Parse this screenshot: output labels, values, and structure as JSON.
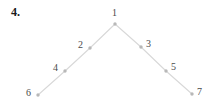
{
  "figure": {
    "problem_number": "4.",
    "caption": "",
    "background_color": "#ffffff",
    "edge_color": "#d8d8d8",
    "node_color": "#b8b8b8",
    "label_color": "#4a4a4a"
  },
  "chart_data": {
    "type": "diagram",
    "diagram_kind": "graph-path",
    "title": "4.",
    "xlabel": "",
    "ylabel": "",
    "nodes": [
      {
        "id": "1",
        "label": "1",
        "x": 115,
        "y": 24,
        "label_x": 112,
        "label_y": 8,
        "label_anchor": "above"
      },
      {
        "id": "2",
        "label": "2",
        "x": 90,
        "y": 48,
        "label_x": 78,
        "label_y": 40,
        "label_anchor": "left"
      },
      {
        "id": "3",
        "label": "3",
        "x": 141,
        "y": 47,
        "label_x": 146,
        "label_y": 39,
        "label_anchor": "right"
      },
      {
        "id": "4",
        "label": "4",
        "x": 65,
        "y": 71,
        "label_x": 53,
        "label_y": 63,
        "label_anchor": "left"
      },
      {
        "id": "5",
        "label": "5",
        "x": 166,
        "y": 71,
        "label_x": 171,
        "label_y": 62,
        "label_anchor": "right"
      },
      {
        "id": "6",
        "label": "6",
        "x": 38,
        "y": 95,
        "label_x": 26,
        "label_y": 88,
        "label_anchor": "left"
      },
      {
        "id": "7",
        "label": "7",
        "x": 192,
        "y": 94,
        "label_x": 197,
        "label_y": 87,
        "label_anchor": "right"
      }
    ],
    "edges": [
      {
        "from": "1",
        "to": "2"
      },
      {
        "from": "2",
        "to": "4"
      },
      {
        "from": "4",
        "to": "6"
      },
      {
        "from": "1",
        "to": "3"
      },
      {
        "from": "3",
        "to": "5"
      },
      {
        "from": "5",
        "to": "7"
      }
    ],
    "legend": [],
    "annotations": []
  }
}
